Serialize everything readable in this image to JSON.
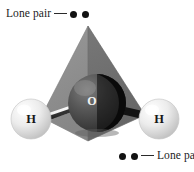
{
  "figure": {
    "background_color": "#ffffff"
  },
  "annotations": {
    "top": {
      "text": "Lone pair",
      "dash": "—",
      "dot_count": 2,
      "dot_color": "#121212",
      "order": "text-dash-dots"
    },
    "bottom": {
      "text": "Lone pair",
      "dash": "—",
      "dot_count": 2,
      "dot_color": "#121212",
      "order": "dots-dash-text"
    }
  },
  "atoms": {
    "oxygen": {
      "label": "O",
      "label_color": "#f2f2f2",
      "sphere_color": "#4a4a4a",
      "shadow_color": "#0a0a0a"
    },
    "hydrogen_left": {
      "label": "H",
      "label_color": "#171717",
      "sphere_color": "#e6e6e6"
    },
    "hydrogen_right": {
      "label": "H",
      "label_color": "#171717",
      "sphere_color": "#e6e6e6"
    }
  },
  "bonds": {
    "left_bond_color": "#f5f5f5",
    "right_bond_color": "#111111"
  },
  "tetrahedron": {
    "left_face_color": "#8e8e8e",
    "right_face_color": "#6e6e6e",
    "bottom_face_color": "#9a9a9a",
    "edge_color": "#5a5a5a"
  }
}
